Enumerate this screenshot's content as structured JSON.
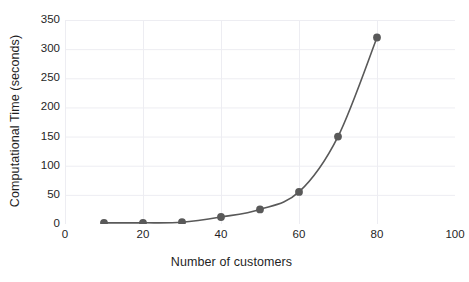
{
  "chart_data": {
    "type": "line",
    "title": "",
    "xlabel": "Number of customers",
    "ylabel": "Computational Time (seconds)",
    "x": [
      10,
      20,
      30,
      40,
      50,
      60,
      70,
      80
    ],
    "values": [
      2,
      2,
      3,
      12,
      25,
      55,
      150,
      320
    ],
    "series": [
      {
        "name": "Computational Time",
        "x": [
          10,
          20,
          30,
          40,
          50,
          60,
          70,
          80
        ],
        "values": [
          2,
          2,
          3,
          12,
          25,
          55,
          150,
          320
        ]
      }
    ],
    "xlim": [
      0,
      100
    ],
    "ylim": [
      0,
      350
    ],
    "xticks": [
      "0",
      "20",
      "40",
      "60",
      "80",
      "100"
    ],
    "xtick_values": [
      0,
      20,
      40,
      60,
      80,
      100
    ],
    "yticks": [
      "0",
      "50",
      "100",
      "150",
      "200",
      "250",
      "300",
      "350"
    ],
    "ytick_values": [
      0,
      50,
      100,
      150,
      200,
      250,
      300,
      350
    ],
    "grid": "both",
    "legend": "none",
    "marker": "circle",
    "line_color": "#595959",
    "marker_color": "#595959",
    "grid_color": "#ededf2",
    "background_color": "#ffffff",
    "text_color": "#1f1f1f"
  }
}
